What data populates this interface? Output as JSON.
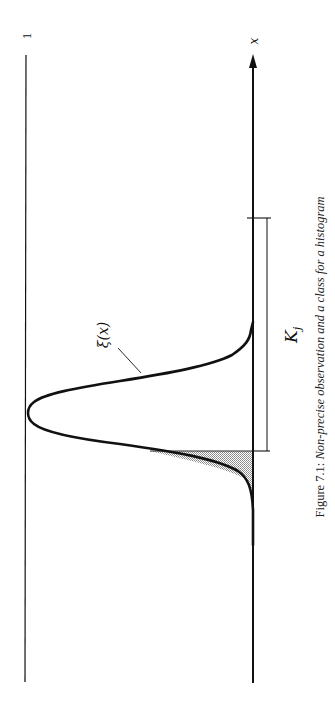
{
  "figure": {
    "orientation": "rotated 90deg counter-clockwise",
    "reference_line_label": "1",
    "axis_label": "x",
    "curve_label": "ξ(x)",
    "interval_label": "K",
    "interval_subscript": "j",
    "caption_prefix": "Figure 7.1:",
    "caption_text": "Non-precise observation and a class for a histogram"
  },
  "colors": {
    "line": "#111111",
    "shade": "#b8b8b8",
    "background": "#ffffff"
  }
}
